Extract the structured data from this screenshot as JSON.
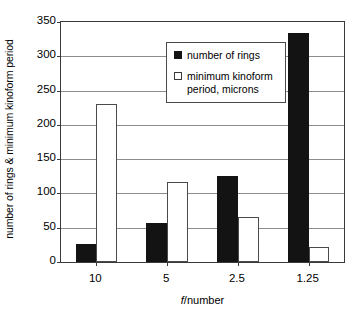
{
  "chart_data": {
    "type": "bar",
    "title": "",
    "xlabel": "f/number",
    "ylabel": "number of rings & minimum kinoform period",
    "categories": [
      "10",
      "5",
      "2.5",
      "1.25"
    ],
    "ylim": [
      0,
      350
    ],
    "yticks": [
      0,
      50,
      100,
      150,
      200,
      250,
      300,
      350
    ],
    "ytick_labels": [
      "0",
      "50",
      "100",
      "150",
      "200",
      "250",
      "300",
      "350"
    ],
    "grid": true,
    "legend_position": "top-center",
    "series": [
      {
        "name": "number of rings",
        "style": "filled",
        "color": "#131313",
        "values": [
          27,
          57,
          126,
          334
        ]
      },
      {
        "name": "minimum kinoform period, microns",
        "style": "open",
        "color": "#ffffff",
        "values": [
          230,
          117,
          66,
          22
        ]
      }
    ]
  },
  "legend": {
    "items": [
      {
        "label": "number of rings",
        "swatch": "filled-square"
      },
      {
        "label": "minimum kinoform\nperiod, microns",
        "swatch": "open-square"
      }
    ]
  },
  "axes": {
    "x_title": "f/number",
    "x_title_italic_part": "f",
    "x_title_rest": "/number",
    "y_title": "number of rings & minimum kinoform period"
  }
}
